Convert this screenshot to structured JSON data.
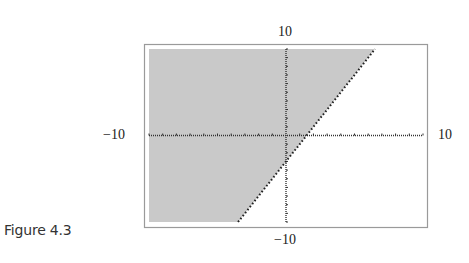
{
  "caption": "Figure 4.3",
  "labels": {
    "top": "10",
    "bottom": "−10",
    "left": "−10",
    "right": "10"
  },
  "colors": {
    "shade": "#c9c9c9",
    "frame": "#9a9a9a",
    "axis": "#333333",
    "boundary": "#222222"
  },
  "chart_data": {
    "type": "area",
    "title": "",
    "caption": "Figure 4.3",
    "inequality": "y > 2x - 3",
    "boundary_line": {
      "slope": 2,
      "intercept": -3,
      "style": "dotted"
    },
    "x_intercept": 1.5,
    "y_intercept": -3,
    "shaded_region": "above the line (left side)",
    "xlim": [
      -10,
      10
    ],
    "ylim": [
      -10,
      10
    ],
    "tick_labels": {
      "x": [
        "-10",
        "10"
      ],
      "y": [
        "-10",
        "10"
      ]
    },
    "tick_interval": 1,
    "grid": false,
    "frame": true,
    "xlabel": "",
    "ylabel": ""
  }
}
